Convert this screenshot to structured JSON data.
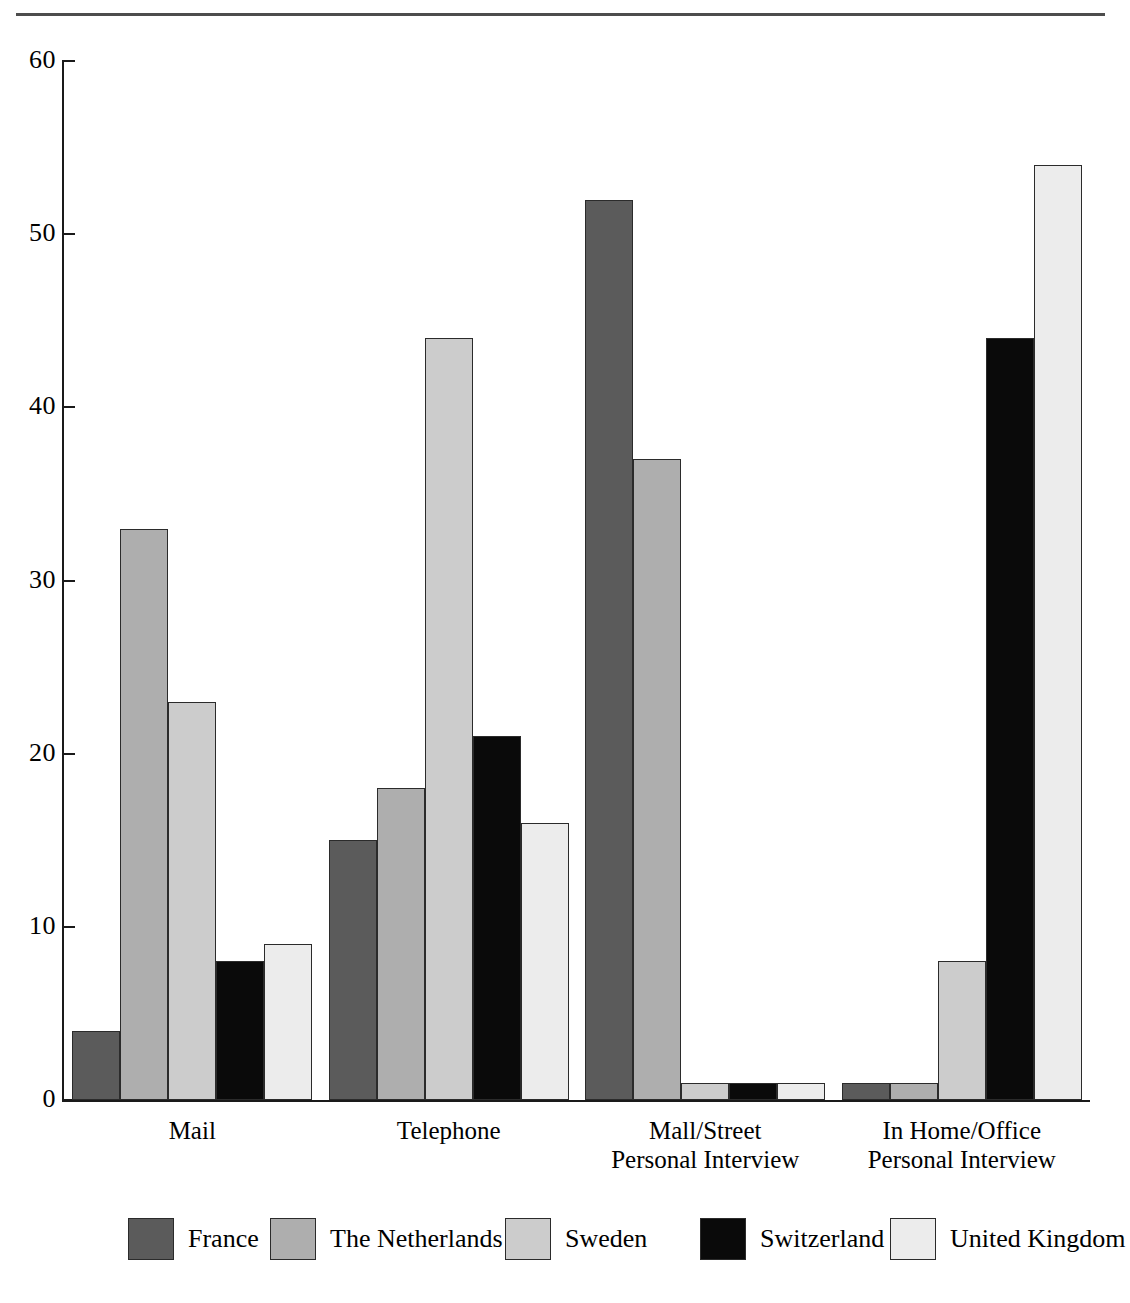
{
  "figure": {
    "background_color": "#ffffff",
    "rule_color": "#4d4d4d",
    "axis_color": "#1a1a1a"
  },
  "chart_data": {
    "type": "bar",
    "title": "",
    "subtitle": "",
    "xlabel": "",
    "ylabel": "",
    "ylim": [
      0,
      60
    ],
    "ytick_values": [
      0,
      10,
      20,
      30,
      40,
      50,
      60
    ],
    "ytick_labels": [
      "0",
      "10",
      "20",
      "30",
      "40",
      "50",
      "60"
    ],
    "grid": false,
    "legend_position": "bottom",
    "categories": [
      "Mail",
      "Telephone",
      "Mall/Street\nPersonal Interview",
      "In Home/Office\nPersonal Interview"
    ],
    "series": [
      {
        "name": "France",
        "color": "#5b5b5b",
        "values": [
          4,
          15,
          52,
          1
        ]
      },
      {
        "name": "The Netherlands",
        "color": "#aeaeae",
        "values": [
          33,
          18,
          37,
          1
        ]
      },
      {
        "name": "Sweden",
        "color": "#cccccc",
        "values": [
          23,
          44,
          1,
          8
        ]
      },
      {
        "name": "Switzerland",
        "color": "#0a0a0a",
        "values": [
          8,
          21,
          1,
          44
        ]
      },
      {
        "name": "United Kingdom",
        "color": "#ececec",
        "values": [
          9,
          16,
          1,
          54
        ]
      }
    ]
  },
  "legend": {
    "items": [
      {
        "label": "France",
        "color": "#5b5b5b"
      },
      {
        "label": "The Netherlands",
        "color": "#aeaeae"
      },
      {
        "label": "Sweden",
        "color": "#cccccc"
      },
      {
        "label": "Switzerland",
        "color": "#0a0a0a"
      },
      {
        "label": "United Kingdom",
        "color": "#ececec"
      }
    ]
  }
}
